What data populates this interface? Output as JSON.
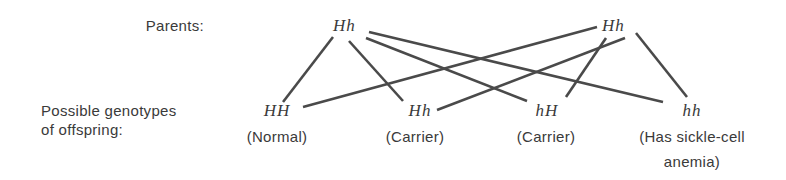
{
  "labels": {
    "parents": "Parents:",
    "offspring_line1": "Possible genotypes",
    "offspring_line2": "of offspring:"
  },
  "parents": [
    {
      "genotype": "Hh"
    },
    {
      "genotype": "Hh"
    }
  ],
  "offspring": [
    {
      "genotype": "HH",
      "description": "(Normal)",
      "description_line2": ""
    },
    {
      "genotype": "Hh",
      "description": "(Carrier)",
      "description_line2": ""
    },
    {
      "genotype": "hH",
      "description": "(Carrier)",
      "description_line2": ""
    },
    {
      "genotype": "hh",
      "description": "(Has sickle-cell",
      "description_line2": "anemia)"
    }
  ],
  "connections": [
    {
      "from": "parent-left",
      "to": "offspring-HH"
    },
    {
      "from": "parent-left",
      "to": "offspring-Hh"
    },
    {
      "from": "parent-left",
      "to": "offspring-hH"
    },
    {
      "from": "parent-left",
      "to": "offspring-hh"
    },
    {
      "from": "parent-right",
      "to": "offspring-HH"
    },
    {
      "from": "parent-right",
      "to": "offspring-Hh"
    },
    {
      "from": "parent-right",
      "to": "offspring-hH"
    },
    {
      "from": "parent-right",
      "to": "offspring-hh"
    }
  ],
  "colors": {
    "text": "#3a3a3a",
    "line": "#4a4a4a",
    "background": "#ffffff"
  }
}
